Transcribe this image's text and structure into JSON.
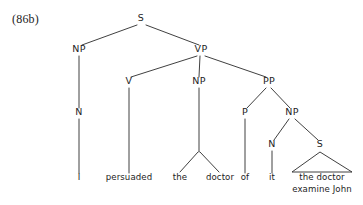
{
  "figure": {
    "example_number": "(86b)",
    "background_color": "#ffffff",
    "line_color": "#2a2a2a",
    "text_color": "#1d1d1d",
    "width": 363,
    "height": 205
  },
  "tree": {
    "description": "Phrase structure tree for the sentence 'I persuaded the doctor of it the doctor examine John'",
    "nodes": [
      {
        "id": "s-root",
        "label": "S",
        "x": 141,
        "y": 21,
        "kind": "category"
      },
      {
        "id": "np-subject",
        "label": "NP",
        "x": 79,
        "y": 52,
        "kind": "category"
      },
      {
        "id": "vp",
        "label": "VP",
        "x": 201,
        "y": 52,
        "kind": "category"
      },
      {
        "id": "n-subject",
        "label": "N",
        "x": 79,
        "y": 115,
        "kind": "category"
      },
      {
        "id": "v",
        "label": "V",
        "x": 129,
        "y": 84,
        "kind": "category"
      },
      {
        "id": "np-object",
        "label": "NP",
        "x": 199,
        "y": 84,
        "kind": "category"
      },
      {
        "id": "pp",
        "label": "PP",
        "x": 269,
        "y": 84,
        "kind": "category"
      },
      {
        "id": "p",
        "label": "P",
        "x": 245,
        "y": 115,
        "kind": "category"
      },
      {
        "id": "np-embedded",
        "label": "NP",
        "x": 292,
        "y": 115,
        "kind": "category"
      },
      {
        "id": "n-it",
        "label": "N",
        "x": 272,
        "y": 147,
        "kind": "category"
      },
      {
        "id": "s-embedded",
        "label": "S",
        "x": 320,
        "y": 147,
        "kind": "category"
      }
    ],
    "terminals": [
      {
        "id": "word-i",
        "label": "I",
        "x": 79,
        "y": 180,
        "parent": "n-subject"
      },
      {
        "id": "word-persuaded",
        "label": "persuaded",
        "x": 129,
        "y": 180,
        "parent": "v"
      },
      {
        "id": "word-the",
        "label": "the",
        "x": 180,
        "y": 180,
        "parent": "np-object"
      },
      {
        "id": "word-doctor",
        "label": "doctor",
        "x": 220,
        "y": 180,
        "parent": "np-object"
      },
      {
        "id": "word-of",
        "label": "of",
        "x": 245,
        "y": 180,
        "parent": "p"
      },
      {
        "id": "word-it",
        "label": "it",
        "x": 272,
        "y": 180,
        "parent": "n-it"
      }
    ],
    "triangle_terminal": {
      "id": "clause-the-doctor-examine-john",
      "parent": "s-embedded",
      "lines": [
        "the doctor",
        "examine John"
      ],
      "apex_x": 320,
      "apex_y": 152,
      "base_left_x": 292,
      "base_right_x": 352,
      "base_y": 172,
      "line1_x": 322,
      "line1_y": 180,
      "line2_x": 322,
      "line2_y": 192
    },
    "edges": [
      {
        "id": "edge-s-np",
        "from": "s-root",
        "to": "np-subject",
        "x1": 137,
        "y1": 25,
        "x2": 82,
        "y2": 45
      },
      {
        "id": "edge-s-vp",
        "from": "s-root",
        "to": "vp",
        "x1": 146,
        "y1": 25,
        "x2": 199,
        "y2": 45
      },
      {
        "id": "edge-np-n",
        "from": "np-subject",
        "to": "n-subject",
        "x1": 79,
        "y1": 56,
        "x2": 79,
        "y2": 108
      },
      {
        "id": "edge-n-i",
        "from": "n-subject",
        "to": "word-i",
        "x1": 79,
        "y1": 119,
        "x2": 79,
        "y2": 173
      },
      {
        "id": "edge-vp-v",
        "from": "vp",
        "to": "v",
        "x1": 197,
        "y1": 56,
        "x2": 131,
        "y2": 77
      },
      {
        "id": "edge-vp-npobj",
        "from": "vp",
        "to": "np-object",
        "x1": 200,
        "y1": 56,
        "x2": 199,
        "y2": 77
      },
      {
        "id": "edge-vp-pp",
        "from": "vp",
        "to": "pp",
        "x1": 205,
        "y1": 56,
        "x2": 266,
        "y2": 77
      },
      {
        "id": "edge-v-persuaded",
        "from": "v",
        "to": "word-persuaded",
        "x1": 129,
        "y1": 88,
        "x2": 129,
        "y2": 173
      },
      {
        "id": "edge-npobj-stem",
        "from": "np-object",
        "to": "np-object-split",
        "x1": 199,
        "y1": 88,
        "x2": 199,
        "y2": 152
      },
      {
        "id": "edge-npobj-the",
        "from": "np-object",
        "to": "word-the",
        "x1": 198,
        "y1": 152,
        "x2": 180,
        "y2": 172
      },
      {
        "id": "edge-npobj-doctor",
        "from": "np-object",
        "to": "word-doctor",
        "x1": 200,
        "y1": 152,
        "x2": 219,
        "y2": 172
      },
      {
        "id": "edge-pp-p",
        "from": "pp",
        "to": "p",
        "x1": 266,
        "y1": 88,
        "x2": 247,
        "y2": 108
      },
      {
        "id": "edge-pp-np",
        "from": "pp",
        "to": "np-embedded",
        "x1": 271,
        "y1": 88,
        "x2": 290,
        "y2": 108
      },
      {
        "id": "edge-p-of",
        "from": "p",
        "to": "word-of",
        "x1": 245,
        "y1": 119,
        "x2": 245,
        "y2": 173
      },
      {
        "id": "edge-np-n-it",
        "from": "np-embedded",
        "to": "n-it",
        "x1": 289,
        "y1": 119,
        "x2": 274,
        "y2": 140
      },
      {
        "id": "edge-np-s",
        "from": "np-embedded",
        "to": "s-embedded",
        "x1": 295,
        "y1": 119,
        "x2": 318,
        "y2": 140
      },
      {
        "id": "edge-n-it-word",
        "from": "n-it",
        "to": "word-it",
        "x1": 272,
        "y1": 151,
        "x2": 272,
        "y2": 173
      }
    ]
  }
}
